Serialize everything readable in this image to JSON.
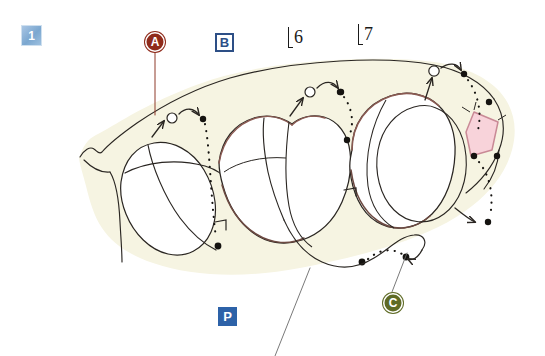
{
  "figure": {
    "canvas": {
      "width": 545,
      "height": 356
    },
    "background_color": "#ffffff",
    "tissue_fill_color": "#f6f4e2",
    "ink_color": "#2a2622",
    "highlight_fill_color": "#f8d3da",
    "highlight_stroke_color": "#c98a96"
  },
  "labels": {
    "step": {
      "text": "1",
      "type": "square-badge",
      "color": "#7ba7d0",
      "text_color": "#ffffff"
    },
    "a": {
      "text": "A",
      "type": "circle-badge",
      "color": "#8f2b1b",
      "text_color": "#ffffff"
    },
    "b": {
      "text": "B",
      "type": "square-outline-badge",
      "color": "#2d4f86",
      "text_color": "#2d4f86"
    },
    "c": {
      "text": "C",
      "type": "circle-badge",
      "color": "#5f6b26",
      "text_color": "#ffffff"
    },
    "p": {
      "text": "P",
      "type": "square-badge",
      "color": "#2d62a8",
      "text_color": "#ffffff"
    },
    "six": {
      "text": "6",
      "type": "bracket-numeral",
      "color": "#1a1a1a"
    },
    "seven": {
      "text": "7",
      "type": "bracket-numeral",
      "color": "#1a1a1a"
    }
  },
  "leader_lines": [
    {
      "name": "leader-a",
      "from_label": "A",
      "color": "#8f3a2a"
    },
    {
      "name": "leader-c",
      "from_label": "C",
      "color": "#5a5a5a"
    },
    {
      "name": "leader-p",
      "from_label": "P",
      "color": "#5a5a5a"
    }
  ],
  "drawing_elements": {
    "tissue_outline": "soft-tissue-outline",
    "crowns": [
      "crown-1",
      "crown-2",
      "crown-3",
      "crown-4"
    ],
    "highlight_patch": "pink-quadrilateral-patch",
    "marker_motifs": [
      {
        "name": "marker-motif-left",
        "parts": [
          "up-arrow",
          "open-circle",
          "curved-arrow",
          "filled-dot",
          "dotted-path"
        ]
      },
      {
        "name": "marker-motif-center",
        "parts": [
          "up-arrow",
          "open-circle",
          "curved-arrow",
          "filled-dot",
          "dotted-path"
        ]
      },
      {
        "name": "marker-motif-right",
        "parts": [
          "up-arrow",
          "open-circle",
          "curved-arrow",
          "filled-dot",
          "dotted-path"
        ]
      },
      {
        "name": "marker-motif-lower-right",
        "parts": [
          "curved-arrow",
          "filled-dot",
          "dotted-path"
        ]
      }
    ]
  }
}
